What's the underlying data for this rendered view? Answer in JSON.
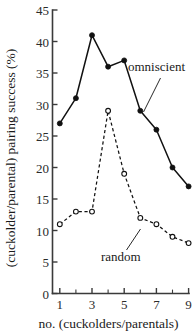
{
  "chart_data": {
    "type": "line",
    "title": "",
    "xlabel": "no. (cuckolders/parentals)",
    "ylabel": "(cuckolder/parental) pairing success  (%)",
    "x": [
      1,
      2,
      3,
      4,
      5,
      6,
      7,
      8,
      9
    ],
    "xlim": [
      0.6,
      9.4
    ],
    "ylim": [
      0,
      45
    ],
    "grid": false,
    "legend_position": "inline-annotations",
    "x_ticks_major": [
      1,
      3,
      5,
      7,
      9
    ],
    "x_ticks_minor": [
      2,
      4,
      6,
      8
    ],
    "x_tick_labels": [
      "1",
      "3",
      "5",
      "7",
      "9"
    ],
    "y_ticks": [
      0,
      5,
      10,
      15,
      20,
      25,
      30,
      35,
      40,
      45
    ],
    "y_tick_labels": [
      "0",
      "5",
      "10",
      "15",
      "20",
      "25",
      "30",
      "35",
      "40",
      "45"
    ],
    "series": [
      {
        "name": "omniscient",
        "marker": "filled-circle",
        "line_style": "solid",
        "color": "#111111",
        "values": [
          27,
          31,
          41,
          36,
          37,
          29,
          26,
          20,
          17
        ]
      },
      {
        "name": "random",
        "marker": "open-circle",
        "line_style": "dashed",
        "color": "#111111",
        "values": [
          11,
          13,
          13,
          29,
          19,
          12,
          11,
          9,
          8
        ]
      }
    ],
    "annotations": [
      {
        "text": "omniscient",
        "x_px": 128,
        "y_px": 71
      },
      {
        "text": "random",
        "x_px": 101,
        "y_px": 259
      }
    ]
  },
  "axes": {
    "y_title": "(cuckolder/parental) pairing success  (%)",
    "x_title": "no. (cuckolders/parentals)"
  }
}
